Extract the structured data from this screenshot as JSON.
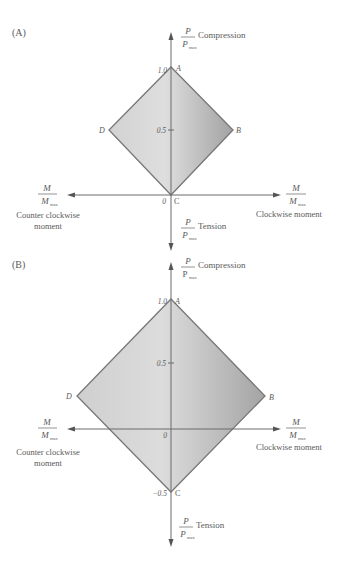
{
  "panels": [
    {
      "label": "(A)",
      "points": {
        "A": "A",
        "B": "B",
        "C": "C",
        "D": "D"
      },
      "ticks": {
        "top": "1.0",
        "mid": "0.5",
        "origin": "0"
      },
      "y_axis_top": {
        "num": "P",
        "den": "P",
        "den_sub": "max",
        "text": "Compression"
      },
      "y_axis_bottom": {
        "num": "P",
        "den": "P",
        "den_sub": "max",
        "text": "Tension"
      },
      "x_axis_left": {
        "num": "M",
        "den": "M",
        "den_sub": "max",
        "line1": "Counter clockwise",
        "line2": "moment"
      },
      "x_axis_right": {
        "num": "M",
        "den": "M",
        "den_sub": "max",
        "line1": "Clockwise moment"
      }
    },
    {
      "label": "(B)",
      "points": {
        "A": "A",
        "B": "B",
        "C": "C",
        "D": "D"
      },
      "ticks": {
        "top": "1.0",
        "mid": "0.5",
        "origin": "0",
        "bottom": "−0.5"
      },
      "y_axis_top": {
        "num": "P",
        "den": "P",
        "den_sub": "max",
        "text": "Compression"
      },
      "y_axis_bottom": {
        "num": "P",
        "den": "P",
        "den_sub": "max",
        "text": "Tension"
      },
      "x_axis_left": {
        "num": "M",
        "den": "M",
        "den_sub": "max",
        "line1": "Counter clockwise",
        "line2": "moment"
      },
      "x_axis_right": {
        "num": "M",
        "den": "M",
        "den_sub": "max",
        "line1": "Clockwise moment"
      }
    }
  ],
  "colors": {
    "fill_light": "#dcdcdc",
    "fill_dark": "#a6a6a6",
    "outline": "#777777",
    "axis": "#6a6a6a"
  }
}
